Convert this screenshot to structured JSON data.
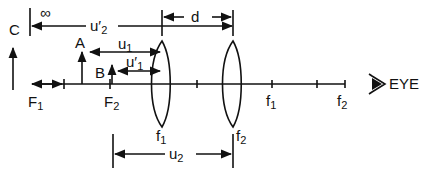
{
  "diagram": {
    "labels": {
      "infinity": "∞",
      "u2_prime": "u′",
      "u2_prime_sub": "2",
      "d": "d",
      "c": "C",
      "a": "A",
      "b": "B",
      "u1": "u",
      "u1_sub": "1",
      "u1_prime": "u′",
      "u1_prime_sub": "1",
      "eye": "EYE",
      "u2": "u",
      "u2_sub": "2",
      "F1_left": "F",
      "F1_left_sub": "1",
      "F2_left": "F",
      "F2_left_sub": "2",
      "lens1": "f",
      "lens1_sub": "1",
      "lens2": "f",
      "lens2_sub": "2",
      "f1_right": "f",
      "f1_right_sub": "1",
      "f2_right": "f",
      "f2_right_sub": "2"
    },
    "colors": {
      "ink": "#111111",
      "background": "#ffffff"
    }
  }
}
